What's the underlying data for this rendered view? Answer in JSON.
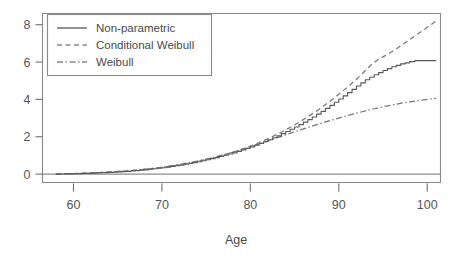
{
  "chart_data": {
    "type": "line",
    "title": "",
    "subtitle": "",
    "xlabel": "Age",
    "ylabel": "",
    "xlim": [
      56.5,
      101.5
    ],
    "ylim": [
      -0.45,
      8.6
    ],
    "xticks": [
      60,
      70,
      80,
      90,
      100
    ],
    "yticks": [
      0,
      2,
      4,
      6,
      8
    ],
    "xtick_labels": [
      "60",
      "70",
      "80",
      "90",
      "100"
    ],
    "ytick_labels": [
      "0",
      "2",
      "4",
      "6",
      "8"
    ],
    "grid": false,
    "legend_position": "top-left",
    "series": [
      {
        "name": "Non-parametric",
        "style": "solid",
        "color": "#595959",
        "shape": "step",
        "x": [
          58.0,
          60.0,
          62.0,
          64.0,
          66.0,
          68.0,
          70.0,
          72.0,
          74.0,
          76.0,
          78.0,
          80.0,
          81.0,
          82.0,
          83.0,
          84.0,
          85.0,
          86.0,
          87.0,
          88.0,
          89.0,
          90.0,
          91.0,
          92.0,
          93.0,
          94.0,
          95.0,
          96.0,
          97.0,
          98.0,
          98.6,
          101.0
        ],
        "y": [
          0.0,
          0.02,
          0.05,
          0.09,
          0.15,
          0.23,
          0.34,
          0.48,
          0.66,
          0.88,
          1.14,
          1.46,
          1.64,
          1.84,
          2.05,
          2.28,
          2.52,
          2.78,
          3.06,
          3.36,
          3.68,
          4.02,
          4.36,
          4.72,
          5.05,
          5.32,
          5.55,
          5.75,
          5.9,
          6.02,
          6.08,
          6.08
        ]
      },
      {
        "name": "Conditional Weibull",
        "style": "dashed",
        "color": "#777777",
        "shape": "smooth",
        "x": [
          58.0,
          60.0,
          62.0,
          64.0,
          66.0,
          68.0,
          70.0,
          72.0,
          74.0,
          76.0,
          78.0,
          80.0,
          82.0,
          84.0,
          86.0,
          88.0,
          90.0,
          92.0,
          94.0,
          96.0,
          98.0,
          100.0,
          101.0
        ],
        "y": [
          0.0,
          0.03,
          0.06,
          0.11,
          0.17,
          0.25,
          0.36,
          0.5,
          0.68,
          0.9,
          1.17,
          1.5,
          1.9,
          2.37,
          2.92,
          3.55,
          4.27,
          5.08,
          5.98,
          6.55,
          7.2,
          7.86,
          8.2
        ]
      },
      {
        "name": "Weibull",
        "style": "dashdot",
        "color": "#777777",
        "shape": "smooth",
        "x": [
          58.0,
          60.0,
          62.0,
          64.0,
          66.0,
          68.0,
          70.0,
          72.0,
          74.0,
          76.0,
          78.0,
          80.0,
          82.0,
          84.0,
          86.0,
          88.0,
          90.0,
          92.0,
          94.0,
          96.0,
          98.0,
          100.0,
          101.0
        ],
        "y": [
          0.0,
          0.03,
          0.06,
          0.11,
          0.17,
          0.26,
          0.37,
          0.52,
          0.7,
          0.92,
          1.17,
          1.46,
          1.78,
          2.1,
          2.42,
          2.72,
          3.0,
          3.26,
          3.5,
          3.7,
          3.87,
          4.0,
          4.06
        ]
      }
    ],
    "baseline_y": 0
  },
  "legend": {
    "items": [
      {
        "label": "Non-parametric"
      },
      {
        "label": "Conditional Weibull"
      },
      {
        "label": "Weibull"
      }
    ]
  },
  "axis": {
    "x_title": "Age"
  },
  "colors": {
    "frame": "#8a8a8a",
    "solid_curve": "#595959",
    "dashed_curve": "#777777",
    "dashdot_curve": "#777777",
    "text": "#4a4a4a",
    "background": "#ffffff"
  }
}
